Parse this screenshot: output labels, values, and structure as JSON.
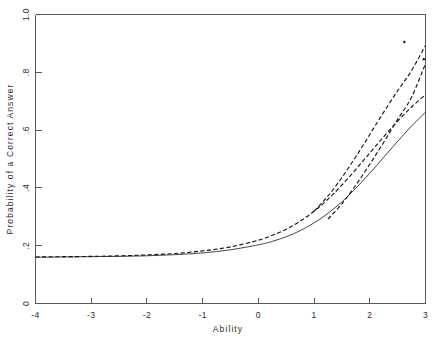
{
  "chart_data": {
    "type": "line",
    "title": "",
    "xlabel": "Ability",
    "ylabel": "Probability of a Correct Answer",
    "xlim": [
      -4,
      3
    ],
    "ylim": [
      0,
      1
    ],
    "grid": false,
    "legend_position": "none",
    "xticks": [
      -4,
      -3,
      -2,
      -1,
      0,
      1,
      2,
      3
    ],
    "xticklabels": [
      "-4",
      "-3",
      "-2",
      "-1",
      "0",
      "1",
      "2",
      "3"
    ],
    "yticks": [
      0,
      0.2,
      0.4,
      0.6,
      0.8,
      1.0
    ],
    "yticklabels": [
      "0",
      ".2",
      ".4",
      ".6",
      ".8",
      "1.0"
    ],
    "series": [
      {
        "name": "dashed-curve",
        "style": "dashed",
        "model": "3PL item characteristic curve",
        "guessing_c": 0.16,
        "difficulty_b": 1.75,
        "discrimination_a": 1.05,
        "x": [
          -4.0,
          -3.5,
          -3.0,
          -2.5,
          -2.0,
          -1.5,
          -1.0,
          -0.5,
          0.0,
          0.25,
          0.5,
          0.75,
          1.0,
          1.25,
          1.5,
          1.75,
          2.0,
          2.25,
          2.5,
          2.75,
          3.0
        ],
        "y": [
          0.161,
          0.162,
          0.163,
          0.165,
          0.168,
          0.173,
          0.182,
          0.196,
          0.219,
          0.236,
          0.257,
          0.285,
          0.319,
          0.361,
          0.41,
          0.464,
          0.521,
          0.577,
          0.631,
          0.68,
          0.723
        ]
      },
      {
        "name": "solid-curve",
        "style": "solid",
        "model": "3PL item characteristic curve",
        "guessing_c": 0.16,
        "difficulty_b": 2.15,
        "discrimination_a": 1.05,
        "x": [
          -4.0,
          -3.5,
          -3.0,
          -2.5,
          -2.0,
          -1.5,
          -1.0,
          -0.5,
          0.0,
          0.25,
          0.5,
          0.75,
          1.0,
          1.25,
          1.5,
          1.75,
          2.0,
          2.25,
          2.5,
          2.75,
          3.0
        ],
        "y": [
          0.16,
          0.161,
          0.162,
          0.163,
          0.165,
          0.169,
          0.175,
          0.186,
          0.203,
          0.215,
          0.231,
          0.252,
          0.279,
          0.312,
          0.352,
          0.399,
          0.451,
          0.506,
          0.561,
          0.614,
          0.662
        ]
      },
      {
        "name": "upper-dotted-extension",
        "style": "dotted",
        "description": "upper dotted trace continuing past 0.72 toward 0.89 at Ability 3",
        "x": [
          1.0,
          1.25,
          1.5,
          1.75,
          2.0,
          2.25,
          2.5,
          2.75,
          3.0
        ],
        "y": [
          0.319,
          0.372,
          0.436,
          0.508,
          0.585,
          0.662,
          0.736,
          0.806,
          0.893
        ]
      },
      {
        "name": "lower-dotted-extension",
        "style": "dotted",
        "description": "lower dotted trace continuing toward 0.83 at Ability 3",
        "x": [
          1.25,
          1.5,
          1.75,
          2.0,
          2.25,
          2.5,
          2.75,
          3.0
        ],
        "y": [
          0.292,
          0.345,
          0.41,
          0.482,
          0.558,
          0.637,
          0.714,
          0.83
        ]
      }
    ],
    "annotations": [
      {
        "name": "stray-point-upper",
        "x": 2.62,
        "y": 0.905
      },
      {
        "name": "stray-point-right",
        "x": 2.97,
        "y": 0.845
      }
    ]
  },
  "axes": {
    "x_title": "Ability",
    "y_title": "Probability of a Correct Answer"
  }
}
